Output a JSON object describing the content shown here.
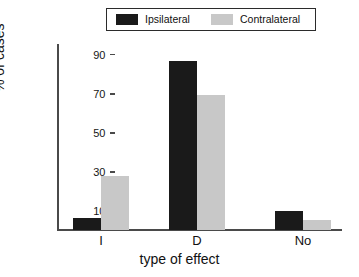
{
  "chart_data": {
    "type": "bar",
    "title": "",
    "subtitle": "",
    "xlabel": "type of effect",
    "ylabel": "% of cases",
    "categories": [
      "I",
      "D",
      "No"
    ],
    "series": [
      {
        "name": "Ipsilateral",
        "color": "#1a1a1a",
        "values": [
          6,
          86.5,
          9.5
        ]
      },
      {
        "name": "Contralateral",
        "color": "#c8c8c8",
        "values": [
          27.5,
          69,
          5
        ]
      }
    ],
    "ylim": [
      0,
      95
    ],
    "yticks": [
      10,
      30,
      50,
      70,
      90
    ],
    "ytick_labels": [
      "10",
      "30",
      "50",
      "70",
      "90"
    ],
    "grid": false,
    "legend_position": "top-center",
    "axis_color": "#4a4a4a",
    "background": "#ffffff"
  },
  "legend": {
    "entries": [
      {
        "label": "Ipsilateral",
        "swatch_color": "#1a1a1a"
      },
      {
        "label": "Contralateral",
        "swatch_color": "#c8c8c8"
      }
    ]
  },
  "axes": {
    "y_title": "% of cases",
    "x_title": "type of effect",
    "y_ticks": [
      "10",
      "30",
      "50",
      "70",
      "90"
    ],
    "x_ticks": [
      "I",
      "D",
      "No"
    ]
  }
}
